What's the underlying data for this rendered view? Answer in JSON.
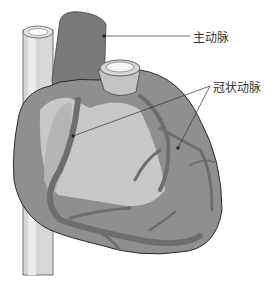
{
  "diagram": {
    "labels": [
      {
        "id": "aorta",
        "text": "主动脉"
      },
      {
        "id": "coronary-artery",
        "text": "冠状动脉"
      }
    ],
    "colors": {
      "heart_dark": "#7a7a7a",
      "heart_mid": "#8f8f8f",
      "heart_light": "#c8c8c8",
      "vessel": "#6e6e6e",
      "vein": "#d9d9d9",
      "outline": "#2a2a2a"
    }
  }
}
